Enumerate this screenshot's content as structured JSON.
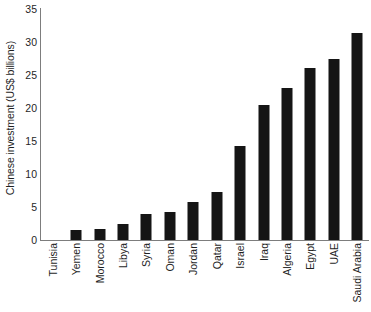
{
  "chart_data": {
    "type": "bar",
    "title": "",
    "xlabel": "",
    "ylabel": "Chinese investment (US$ billions)",
    "ylim": [
      0,
      35
    ],
    "yticks": [
      0,
      5,
      10,
      15,
      20,
      25,
      30,
      35
    ],
    "grid": false,
    "legend": false,
    "bar_color": "#151515",
    "axis_color": "#7d7d7d",
    "categories": [
      "Tunisia",
      "Yemen",
      "Morocco",
      "Libya",
      "Syria",
      "Oman",
      "Jordan",
      "Qatar",
      "Israel",
      "Iraq",
      "Algeria",
      "Egypt",
      "UAE",
      "Saudi Arabia"
    ],
    "values": [
      0,
      1.5,
      1.7,
      2.5,
      4.0,
      4.3,
      5.8,
      7.3,
      14.2,
      20.5,
      23.0,
      26.0,
      27.4,
      31.4
    ]
  }
}
